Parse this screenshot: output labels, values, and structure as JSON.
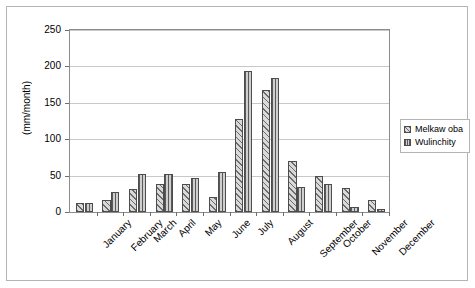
{
  "chart_data": {
    "type": "bar",
    "title": "",
    "xlabel": "",
    "ylabel": "(mm/month)",
    "ylim": [
      0,
      250
    ],
    "ytick_step": 50,
    "yticks": [
      0,
      50,
      100,
      150,
      200,
      250
    ],
    "ytick_labels": [
      "0",
      "50",
      "100",
      "150",
      "200",
      "250"
    ],
    "grid": true,
    "legend_position": "right",
    "categories": [
      "January",
      "February",
      "March",
      "April",
      "May",
      "June",
      "July",
      "August",
      "September",
      "October",
      "November",
      "December"
    ],
    "series": [
      {
        "name": "Melkaw oba",
        "pattern": "diagonal-hatch",
        "color": "#d9d9d9",
        "values": [
          12,
          16,
          31,
          39,
          38,
          21,
          128,
          168,
          70,
          50,
          33,
          17
        ]
      },
      {
        "name": "Wulinchity",
        "pattern": "vertical-hatch",
        "color": "#cfcfcf",
        "values": [
          12,
          27,
          52,
          52,
          47,
          55,
          194,
          184,
          34,
          38,
          7,
          4
        ]
      }
    ]
  },
  "legend": {
    "items": [
      {
        "label": "Melkaw oba"
      },
      {
        "label": "Wulinchity"
      }
    ]
  },
  "axis": {
    "y_title": "(mm/month)"
  }
}
